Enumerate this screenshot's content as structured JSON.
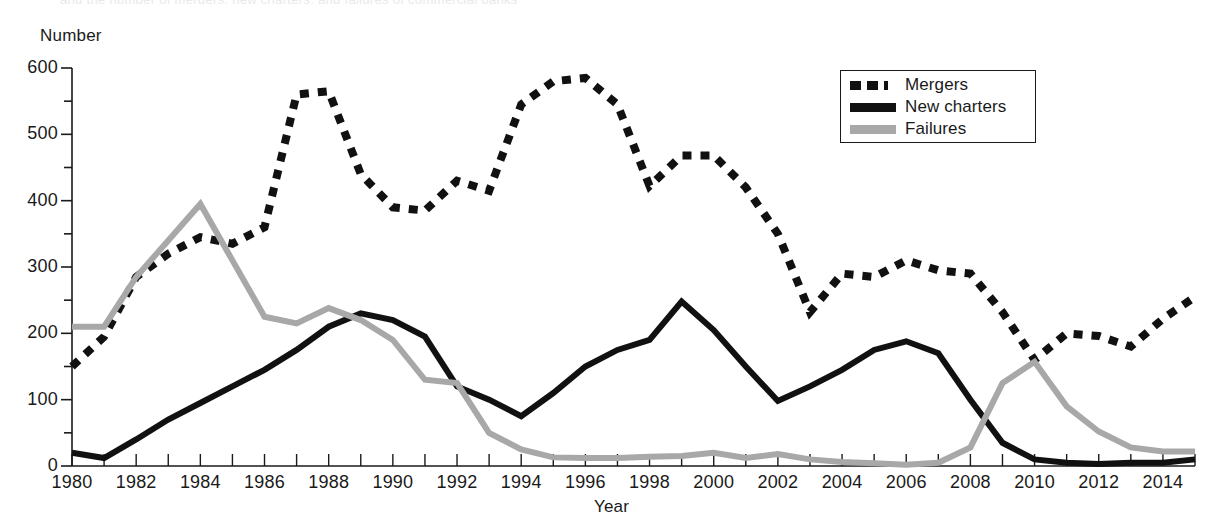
{
  "figure": {
    "top_remnant_text": "and the number of mergers, new charters, and failures of commercial banks",
    "y_axis_title": "Number",
    "x_axis_title": "Year"
  },
  "legend": {
    "position": "top-right",
    "entries": [
      {
        "label": "Mergers",
        "style": "dashed",
        "color": "#111111",
        "swatch": "sw-dashed"
      },
      {
        "label": "New charters",
        "style": "solid",
        "color": "#111111",
        "swatch": "sw-solid-black"
      },
      {
        "label": "Failures",
        "style": "solid",
        "color": "#a8a8a8",
        "swatch": "sw-solid-gray"
      }
    ]
  },
  "axes": {
    "y_ticks": [
      0,
      100,
      200,
      300,
      400,
      500,
      600
    ],
    "y_minor_step": 50,
    "y_min": 0,
    "y_max": 600,
    "x_min": 1980,
    "x_max": 2015,
    "x_tick_step": 1,
    "x_label_step": 2,
    "x_labels": [
      1980,
      1982,
      1984,
      1986,
      1988,
      1990,
      1992,
      1994,
      1996,
      1998,
      2000,
      2002,
      2004,
      2006,
      2008,
      2010,
      2012,
      2014
    ],
    "grid": false
  },
  "chart_data": {
    "type": "line",
    "title": "",
    "xlabel": "Year",
    "ylabel": "Number",
    "xlim": [
      1980,
      2015
    ],
    "ylim": [
      0,
      600
    ],
    "x": [
      1980,
      1981,
      1982,
      1983,
      1984,
      1985,
      1986,
      1987,
      1988,
      1989,
      1990,
      1991,
      1992,
      1993,
      1994,
      1995,
      1996,
      1997,
      1998,
      1999,
      2000,
      2001,
      2002,
      2003,
      2004,
      2005,
      2006,
      2007,
      2008,
      2009,
      2010,
      2011,
      2012,
      2013,
      2014,
      2015
    ],
    "series": [
      {
        "name": "Mergers",
        "color": "#111111",
        "style": "dashed",
        "values": [
          150,
          195,
          285,
          320,
          345,
          335,
          360,
          560,
          565,
          440,
          390,
          385,
          430,
          415,
          545,
          580,
          585,
          545,
          422,
          468,
          468,
          420,
          350,
          232,
          290,
          285,
          310,
          295,
          290,
          232,
          160,
          200,
          196,
          180,
          222,
          255
        ]
      },
      {
        "name": "New charters",
        "color": "#111111",
        "style": "solid",
        "values": [
          20,
          12,
          40,
          70,
          95,
          120,
          145,
          175,
          210,
          230,
          220,
          195,
          120,
          100,
          75,
          110,
          150,
          175,
          190,
          248,
          205,
          150,
          98,
          120,
          145,
          175,
          188,
          170,
          100,
          35,
          10,
          5,
          3,
          5,
          5,
          10
        ]
      },
      {
        "name": "Failures",
        "color": "#a8a8a8",
        "style": "solid",
        "values": [
          210,
          210,
          285,
          340,
          395,
          310,
          225,
          215,
          238,
          220,
          190,
          130,
          125,
          50,
          25,
          13,
          12,
          12,
          14,
          15,
          20,
          12,
          18,
          10,
          6,
          4,
          2,
          5,
          28,
          125,
          157,
          90,
          52,
          28,
          22,
          22
        ]
      }
    ]
  }
}
